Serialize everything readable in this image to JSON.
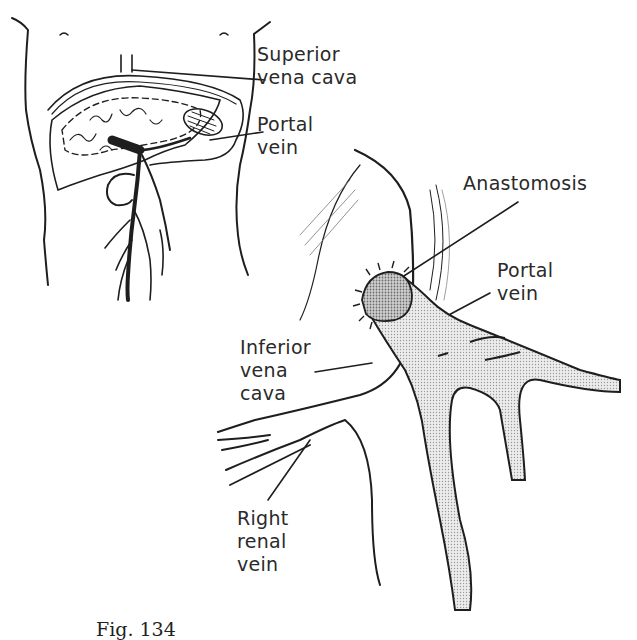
{
  "figure": {
    "caption": "Fig. 134",
    "panels": [
      {
        "id": "torso-overview",
        "description": "Frontal torso outline showing liver, portal system and venous tree",
        "labels": [
          {
            "key": "superior_vena_cava",
            "lines": [
              "Superior",
              "vena cava"
            ]
          },
          {
            "key": "portal_vein_top",
            "lines": [
              "Portal",
              "vein"
            ]
          }
        ]
      },
      {
        "id": "anastomosis-detail",
        "description": "Enlarged view of portacaval anastomosis",
        "labels": [
          {
            "key": "anastomosis",
            "lines": [
              "Anastomosis"
            ]
          },
          {
            "key": "portal_vein_detail",
            "lines": [
              "Portal",
              "vein"
            ]
          },
          {
            "key": "inferior_vena_cava",
            "lines": [
              "Inferior",
              "vena",
              "cava"
            ]
          },
          {
            "key": "right_renal_vein",
            "lines": [
              "Right",
              "renal",
              "vein"
            ]
          }
        ]
      }
    ]
  },
  "colors": {
    "ink": "#1e1e1e",
    "stipple_fill": "#d9d9d9",
    "anastomosis_fill": "#bdbdbd",
    "background": "#ffffff"
  }
}
